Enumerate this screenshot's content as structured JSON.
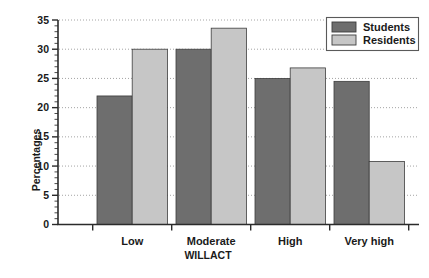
{
  "chart_data": {
    "type": "bar",
    "title": "",
    "subtitle": "",
    "xlabel": "WILLACT",
    "ylabel": "Percentages",
    "categories": [
      "Low",
      "Moderate",
      "High",
      "Very high"
    ],
    "series": [
      {
        "name": "Students",
        "color": "#6e6e6e",
        "values": [
          22.0,
          30.0,
          25.0,
          24.5
        ]
      },
      {
        "name": "Residents",
        "color": "#c6c6c6",
        "values": [
          30.0,
          33.6,
          26.8,
          10.8
        ]
      }
    ],
    "ylim": [
      0,
      35
    ],
    "ytick_values": [
      0,
      5,
      10,
      15,
      20,
      25,
      30,
      35
    ],
    "ytick_labels": [
      "0",
      "5",
      "10",
      "15",
      "20",
      "25",
      "30",
      "35"
    ],
    "ytick_minor_step": 1,
    "grid": "horizontal-dotted",
    "legend_position": "top-right",
    "legend_entries": [
      "Students",
      "Residents"
    ]
  },
  "axis": {
    "y_label": "Percentages",
    "x_label": "WILLACT"
  },
  "colors": {
    "students": "#6e6e6e",
    "residents": "#c6c6c6",
    "axis": "#2b2b2b",
    "grid": "#9a9a9a",
    "background": "#ffffff"
  }
}
